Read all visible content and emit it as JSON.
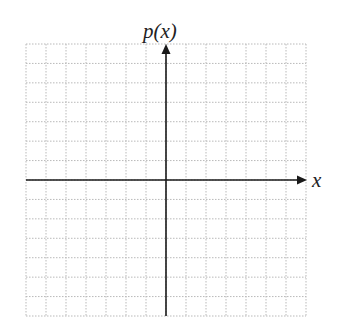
{
  "chart_data": {
    "type": "line",
    "title": "",
    "xlabel": "x",
    "ylabel": "p(x)",
    "grid": true,
    "grid_cells": {
      "columns": 14,
      "rows": 14
    },
    "x_range": [
      -7,
      7
    ],
    "y_range": [
      -7,
      7
    ],
    "tick_labels": [],
    "series": [],
    "legend": null
  },
  "labels": {
    "y_axis": "p(x)",
    "x_axis": "x"
  },
  "colors": {
    "grid": "#b9b9b9",
    "axis": "#1a1a1a",
    "text": "#222222"
  }
}
